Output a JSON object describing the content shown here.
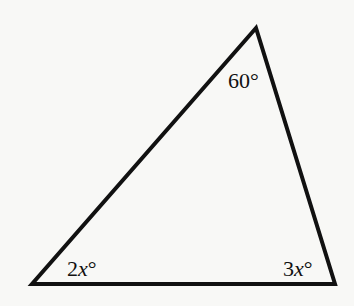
{
  "diagram": {
    "type": "triangle",
    "vertices": {
      "top": [
        256,
        28
      ],
      "bottom_left": [
        32,
        284
      ],
      "bottom_right": [
        335,
        284
      ]
    },
    "stroke_color": "#111111",
    "background_color": "#f8f8f6",
    "angles": {
      "top": {
        "number": "60",
        "variable": "",
        "degree": "°"
      },
      "bottom_left": {
        "number": "2",
        "variable": "x",
        "degree": "°"
      },
      "bottom_right": {
        "number": "3",
        "variable": "x",
        "degree": "°"
      }
    }
  }
}
